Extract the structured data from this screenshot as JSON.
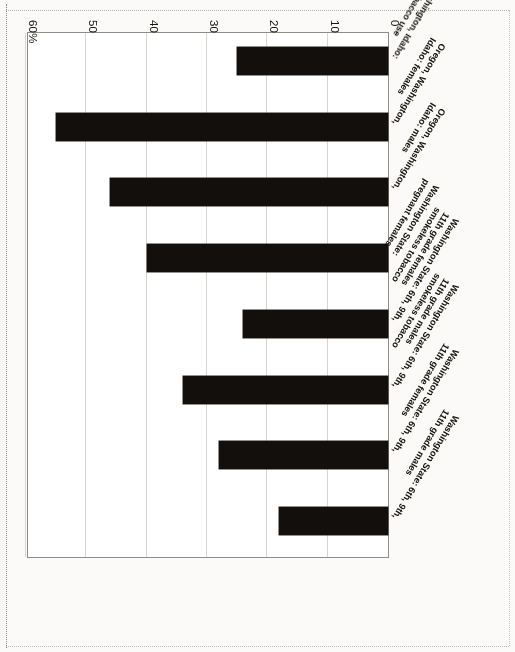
{
  "chart_data": {
    "type": "bar",
    "orientation": "horizontal",
    "title": "",
    "subtitle": "",
    "xlabel": "",
    "ylabel": "",
    "xlim": [
      0,
      60
    ],
    "grid": true,
    "legend": "none",
    "axis_unit": "%",
    "tick_labels": [
      "0",
      "10",
      "20",
      "30",
      "40",
      "50",
      "60%"
    ],
    "tick_values": [
      0,
      10,
      20,
      30,
      40,
      50,
      60
    ],
    "categories": [
      "Washington State: 6th, 9th,\n11th grade males",
      "Washington State: 6th, 9th,\n11th grade females",
      "Washington State: 6th, 9th,\n11th grade males\nsmokeless tobacco",
      "Washington State: 6th, 9th,\n11th grade females\nsmokeless tobacco",
      "Washington State:\npregnant females",
      "Oregon, Washington,\nIdaho: males",
      "Oregon, Washington,\nIdaho: females",
      "Oregon, Washington, Idaho:\nsmokeless tobacco use"
    ],
    "values": [
      18,
      28,
      34,
      24,
      40,
      46,
      55,
      25
    ],
    "bar_color": "#120f0c"
  },
  "figure": {
    "frame_color": "#8e8d89",
    "gridline_color": "#d6d5d1",
    "page_background": "#fbfaf8",
    "plot_background": "#ffffff"
  }
}
